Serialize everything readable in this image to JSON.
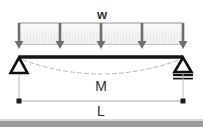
{
  "figure": {
    "labels": {
      "load": "w",
      "moment": "M",
      "length": "L"
    },
    "colors": {
      "beam": "#1a1a1a",
      "arrow": "#6b6b6b",
      "load_box_fill": "#f2f2f2",
      "load_box_stroke": "#8a8a8a",
      "hatch": "#d5d5d5",
      "deflection_dashed": "#b0b0b0",
      "dimension_line": "#a0a0a0",
      "dimension_dot": "#1a1a1a",
      "support_fill": "#ffffff",
      "support_stroke": "#111111",
      "bottom_band": "#9a9a9a",
      "text": "#2e2e2e"
    },
    "geometry": {
      "beam_left_x": 19,
      "beam_right_x": 183,
      "beam_y": 57,
      "load_box_top_y": 23,
      "load_box_bottom_y": 44,
      "arrow_tip_y": 49,
      "dimension_line_y": 101,
      "arrow_count": 5,
      "arrow_x_positions": [
        19,
        60,
        101,
        142,
        183
      ],
      "deflection_mid_sag_y": 76
    },
    "supports": {
      "left": {
        "type": "pinned",
        "name": "pin-support"
      },
      "right": {
        "type": "roller",
        "name": "roller-support"
      }
    }
  }
}
